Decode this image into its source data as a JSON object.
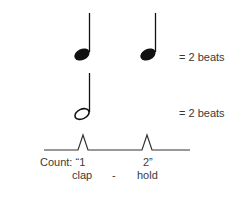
{
  "rows": [
    {
      "notes": [
        "quarter",
        "quarter"
      ],
      "equation": "= 2 beats"
    },
    {
      "notes": [
        "half"
      ],
      "equation": "= 2 beats"
    }
  ],
  "pulse": {
    "count_label": "Count: “1",
    "count_two": "2”",
    "actions": [
      "clap",
      "-",
      "hold"
    ]
  }
}
